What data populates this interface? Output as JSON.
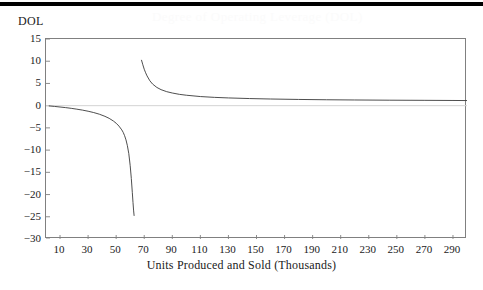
{
  "page": {
    "ghost_title": "Degree of Operating Leverage (DOL)"
  },
  "chart_data": {
    "type": "line",
    "title": "",
    "xlabel": "Units Produced and Sold (Thousands)",
    "ylabel": "DOL",
    "xlim": [
      0,
      300
    ],
    "ylim": [
      -30,
      15
    ],
    "grid": false,
    "legend": "none",
    "zero_line": true,
    "x_ticks": [
      10,
      30,
      50,
      70,
      90,
      110,
      130,
      150,
      170,
      190,
      210,
      230,
      250,
      270,
      290
    ],
    "y_ticks": [
      15,
      10,
      5,
      0,
      -5,
      -10,
      -15,
      -20,
      -25,
      -30
    ],
    "colors": {
      "curve": "#3a3a3a",
      "frame": "#808080",
      "zero_line": "#d4d4d4",
      "rule": "#000000"
    },
    "asymptote_x": 65,
    "series": [
      {
        "name": "DOL below break-even",
        "x": [
          2,
          6,
          10,
          14,
          18,
          22,
          26,
          30,
          34,
          38,
          42,
          45,
          48,
          50,
          52,
          54,
          55,
          56,
          57,
          58,
          59,
          60,
          60.8,
          61.5,
          62,
          62.4,
          62.8
        ],
        "values": [
          -0.05,
          -0.17,
          -0.3,
          -0.44,
          -0.6,
          -0.79,
          -1.0,
          -1.25,
          -1.55,
          -1.92,
          -2.4,
          -2.85,
          -3.45,
          -3.95,
          -4.6,
          -5.45,
          -6.0,
          -6.75,
          -7.7,
          -9.0,
          -10.8,
          -13.5,
          -16.4,
          -19.5,
          -21.8,
          -23.5,
          -24.8
        ]
      },
      {
        "name": "DOL above break-even",
        "x": [
          68,
          69,
          70,
          71,
          72,
          74,
          76,
          79,
          82,
          86,
          90,
          95,
          100,
          110,
          120,
          130,
          145,
          160,
          180,
          200,
          220,
          245,
          270,
          290,
          300
        ],
        "values": [
          10.3,
          9.2,
          8.2,
          7.4,
          6.7,
          5.6,
          4.85,
          4.1,
          3.6,
          3.15,
          2.85,
          2.55,
          2.35,
          2.05,
          1.87,
          1.74,
          1.6,
          1.5,
          1.4,
          1.33,
          1.28,
          1.23,
          1.2,
          1.17,
          1.15
        ]
      }
    ]
  }
}
